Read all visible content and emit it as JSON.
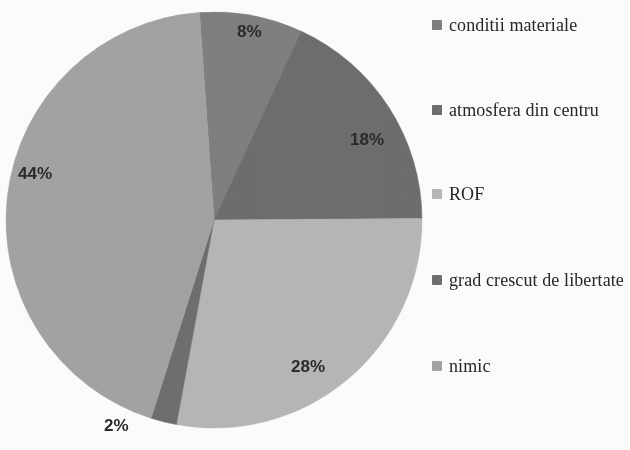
{
  "chart_data": {
    "type": "pie",
    "title": "",
    "labels": [
      "conditii materiale",
      "atmosfera din centru",
      "ROF",
      "grad crescut de libertate",
      "nimic"
    ],
    "values": [
      8,
      18,
      28,
      2,
      44
    ],
    "value_labels": [
      "8%",
      "18%",
      "28%",
      "2%",
      "44%"
    ],
    "unit": "%",
    "colors": [
      "#808080",
      "#6e6e6e",
      "#b7b7b7",
      "#6f6f6f",
      "#a3a3a3"
    ],
    "legend_position": "right",
    "grid": false,
    "start_angle_deg": -4,
    "direction": "clockwise"
  },
  "legend": {
    "items": [
      {
        "label": "conditii materiale",
        "color": "#808080"
      },
      {
        "label": "atmosfera din centru",
        "color": "#6e6e6e"
      },
      {
        "label": "ROF",
        "color": "#b7b7b7"
      },
      {
        "label": "grad crescut de libertate",
        "color": "#6f6f6f"
      },
      {
        "label": "nimic",
        "color": "#a3a3a3"
      }
    ]
  },
  "labels": {
    "slice_0": "8%",
    "slice_1": "18%",
    "slice_2": "28%",
    "slice_3": "2%",
    "slice_4": "44%"
  }
}
